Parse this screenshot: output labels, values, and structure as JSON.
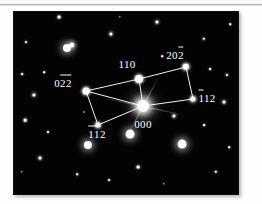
{
  "figure": {
    "type": "electron-diffraction-pattern",
    "plate_background_color": "#030303",
    "spot_color": "#ffffff",
    "net_line_color": "#f2f2f2",
    "page_background_color": "#fdfdfd"
  },
  "labels": [
    {
      "id": "label-022",
      "parts": [
        {
          "text": "0",
          "bar": false
        },
        {
          "text": "2",
          "bar": true
        },
        {
          "text": "2",
          "bar": true
        }
      ],
      "plain": "022",
      "x": 49,
      "y": 71
    },
    {
      "id": "label-110",
      "parts": [
        {
          "text": "110",
          "bar": false
        }
      ],
      "plain": "110",
      "x": 113,
      "y": 52
    },
    {
      "id": "label-202",
      "parts": [
        {
          "text": "20",
          "bar": false
        },
        {
          "text": "2",
          "bar": true
        }
      ],
      "plain": "202",
      "x": 161,
      "y": 43
    },
    {
      "id": "label-112-right",
      "parts": [
        {
          "text": "1",
          "bar": true
        },
        {
          "text": "12",
          "bar": false
        }
      ],
      "plain": "112",
      "x": 193,
      "y": 86
    },
    {
      "id": "label-000",
      "parts": [
        {
          "text": "000",
          "bar": false
        }
      ],
      "plain": "000",
      "x": 129,
      "y": 112
    },
    {
      "id": "label-112-bottom",
      "parts": [
        {
          "text": "1",
          "bar": true
        },
        {
          "text": "1",
          "bar": true
        },
        {
          "text": "2",
          "bar": false
        }
      ],
      "plain": "112",
      "x": 83,
      "y": 122
    }
  ],
  "spots": [
    {
      "id": "spot-022",
      "x": 72,
      "y": 79,
      "r": 3.4,
      "kind": "core"
    },
    {
      "id": "spot-110",
      "x": 125,
      "y": 67,
      "r": 4.0,
      "kind": "core"
    },
    {
      "id": "spot-202",
      "x": 172,
      "y": 55,
      "r": 3.2,
      "kind": "core"
    },
    {
      "id": "spot-112-right",
      "x": 179,
      "y": 87,
      "r": 2.6,
      "kind": "core"
    },
    {
      "id": "spot-000",
      "x": 129,
      "y": 94,
      "r": 6.0,
      "kind": "center"
    },
    {
      "id": "spot-112-bottom",
      "x": 84,
      "y": 113,
      "r": 2.6,
      "kind": "core"
    }
  ],
  "net_edges": [
    {
      "id": "edge-022-110",
      "x1": 72,
      "y1": 79,
      "x2": 125,
      "y2": 67
    },
    {
      "id": "edge-110-202",
      "x1": 125,
      "y1": 67,
      "x2": 172,
      "y2": 55
    },
    {
      "id": "edge-202-112right",
      "x1": 172,
      "y1": 55,
      "x2": 179,
      "y2": 87
    },
    {
      "id": "edge-112right-000",
      "x1": 179,
      "y1": 87,
      "x2": 129,
      "y2": 94
    },
    {
      "id": "edge-000-022",
      "x1": 129,
      "y1": 94,
      "x2": 72,
      "y2": 79
    },
    {
      "id": "edge-000-110",
      "x1": 129,
      "y1": 94,
      "x2": 125,
      "y2": 67
    },
    {
      "id": "edge-022-112bot",
      "x1": 72,
      "y1": 79,
      "x2": 84,
      "y2": 113
    },
    {
      "id": "edge-112bot-000",
      "x1": 84,
      "y1": 113,
      "x2": 129,
      "y2": 94
    }
  ],
  "background_spots": [
    {
      "x": 12,
      "y": 30,
      "r": 1.0
    },
    {
      "x": 45,
      "y": 5,
      "r": 1.4
    },
    {
      "x": 8,
      "y": 62,
      "r": 0.9
    },
    {
      "x": 30,
      "y": 60,
      "r": 0.8
    },
    {
      "x": 53,
      "y": 36,
      "r": 4.0
    },
    {
      "x": 58,
      "y": 33,
      "r": 2.6
    },
    {
      "x": 97,
      "y": 22,
      "r": 1.6
    },
    {
      "x": 143,
      "y": 10,
      "r": 1.5
    },
    {
      "x": 190,
      "y": 27,
      "r": 1.2
    },
    {
      "x": 213,
      "y": 63,
      "r": 1.1
    },
    {
      "x": 196,
      "y": 57,
      "r": 0.9
    },
    {
      "x": 20,
      "y": 83,
      "r": 1.6
    },
    {
      "x": 11,
      "y": 108,
      "r": 1.3
    },
    {
      "x": 210,
      "y": 90,
      "r": 1.5
    },
    {
      "x": 160,
      "y": 104,
      "r": 1.6
    },
    {
      "x": 116,
      "y": 122,
      "r": 4.4
    },
    {
      "x": 74,
      "y": 133,
      "r": 4.1
    },
    {
      "x": 168,
      "y": 132,
      "r": 4.4
    },
    {
      "x": 26,
      "y": 146,
      "r": 1.5
    },
    {
      "x": 124,
      "y": 155,
      "r": 1.4
    },
    {
      "x": 95,
      "y": 168,
      "r": 1.0
    },
    {
      "x": 202,
      "y": 160,
      "r": 1.2
    },
    {
      "x": 34,
      "y": 120,
      "r": 1.0
    },
    {
      "x": 190,
      "y": 113,
      "r": 0.9
    },
    {
      "x": 148,
      "y": 44,
      "r": 0.8
    },
    {
      "x": 63,
      "y": 162,
      "r": 0.8
    },
    {
      "x": 215,
      "y": 135,
      "r": 0.8
    },
    {
      "x": 8,
      "y": 160,
      "r": 0.7
    },
    {
      "x": 106,
      "y": 5,
      "r": 0.7
    },
    {
      "x": 216,
      "y": 12,
      "r": 0.8
    },
    {
      "x": 70,
      "y": 100,
      "r": 0.6
    },
    {
      "x": 150,
      "y": 172,
      "r": 0.7
    }
  ],
  "streaks": [
    {
      "id": "streak-horizontal",
      "angle": 12,
      "length": 82,
      "thickness": 1
    },
    {
      "id": "streak-diagonal",
      "angle": -62,
      "length": 70,
      "thickness": 1
    }
  ]
}
